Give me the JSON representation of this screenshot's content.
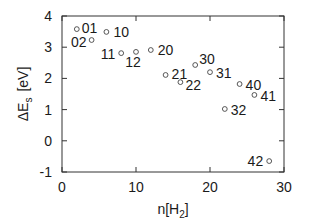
{
  "chart_data": {
    "type": "scatter",
    "title": "",
    "xlabel": "n[H2]",
    "xlabel_main": "n[H",
    "xlabel_sub": "2",
    "xlabel_close": "]",
    "ylabel": "ΔEs [eV]",
    "ylabel_main": "ΔE",
    "ylabel_sub": "s",
    "ylabel_unit": "[eV]",
    "xlim": [
      0,
      30
    ],
    "ylim": [
      -1,
      4
    ],
    "xticks": [
      0,
      10,
      20,
      30
    ],
    "yticks": [
      -1,
      0,
      1,
      2,
      3,
      4
    ],
    "grid": false,
    "legend": "none",
    "marker": "open-circle",
    "points": [
      {
        "label": "01",
        "x": 2,
        "y": 3.58
      },
      {
        "label": "02",
        "x": 4,
        "y": 3.23
      },
      {
        "label": "10",
        "x": 6,
        "y": 3.49
      },
      {
        "label": "11",
        "x": 8,
        "y": 2.81
      },
      {
        "label": "12",
        "x": 10,
        "y": 2.85
      },
      {
        "label": "20",
        "x": 12,
        "y": 2.91
      },
      {
        "label": "21",
        "x": 14,
        "y": 2.11
      },
      {
        "label": "22",
        "x": 16,
        "y": 1.88
      },
      {
        "label": "30",
        "x": 18,
        "y": 2.43
      },
      {
        "label": "31",
        "x": 20,
        "y": 2.2
      },
      {
        "label": "32",
        "x": 22,
        "y": 1.02
      },
      {
        "label": "40",
        "x": 24,
        "y": 1.82
      },
      {
        "label": "41",
        "x": 26,
        "y": 1.47
      },
      {
        "label": "42",
        "x": 28,
        "y": -0.65
      }
    ]
  }
}
